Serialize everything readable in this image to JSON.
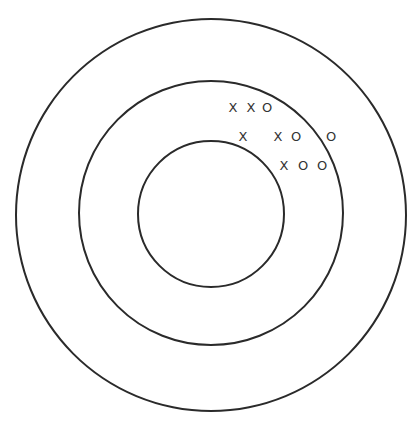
{
  "diagram": {
    "ring_color": "#2a2a2a",
    "center": [
      211,
      214
    ],
    "rings": [
      {
        "name": "outer",
        "radius": 196
      },
      {
        "name": "middle",
        "radius": 133
      },
      {
        "name": "inner",
        "radius": 74
      }
    ],
    "marks": [
      {
        "symbol": "X",
        "x": 233,
        "y": 107
      },
      {
        "symbol": "X",
        "x": 251,
        "y": 107
      },
      {
        "symbol": "O",
        "x": 267,
        "y": 107
      },
      {
        "symbol": "X",
        "x": 243,
        "y": 136
      },
      {
        "symbol": "X",
        "x": 278,
        "y": 136
      },
      {
        "symbol": "O",
        "x": 296,
        "y": 136
      },
      {
        "symbol": "O",
        "x": 331,
        "y": 136
      },
      {
        "symbol": "X",
        "x": 284,
        "y": 165
      },
      {
        "symbol": "O",
        "x": 303,
        "y": 165
      },
      {
        "symbol": "O",
        "x": 322,
        "y": 165
      }
    ]
  }
}
